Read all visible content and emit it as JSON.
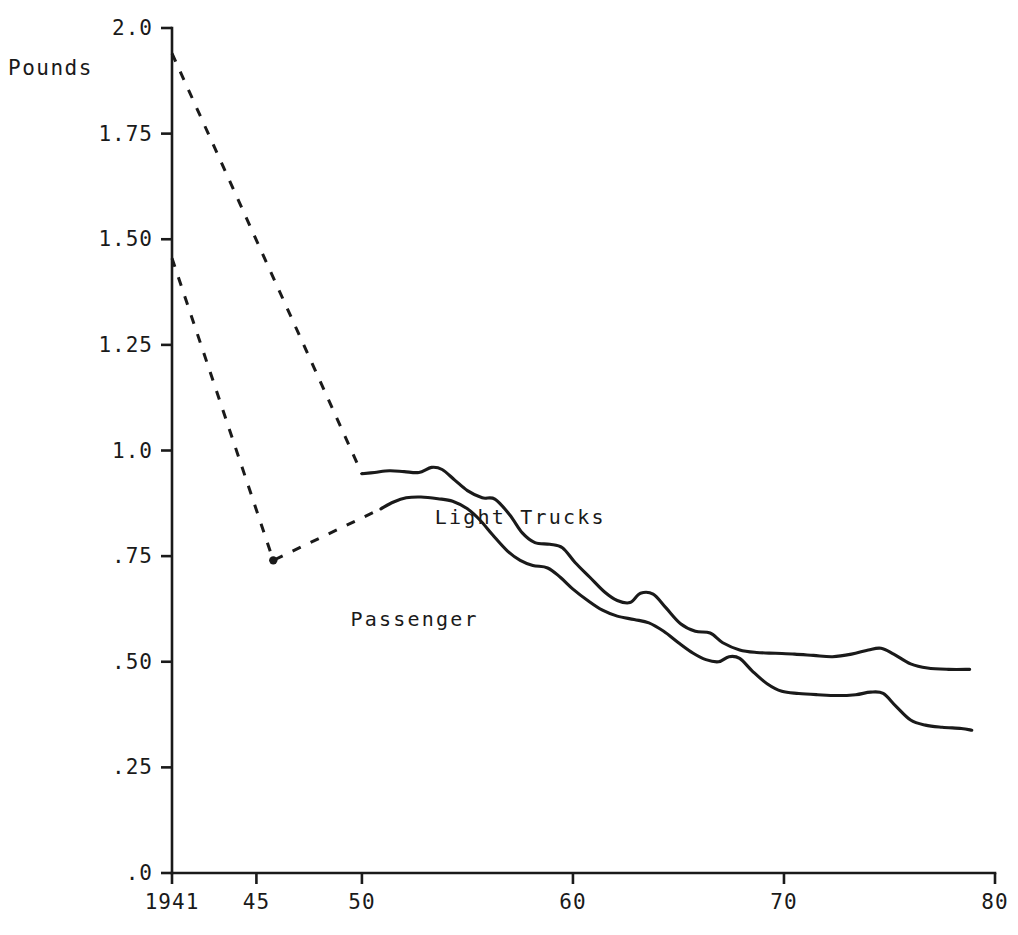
{
  "chart_data": {
    "type": "line",
    "title": "",
    "xlabel": "",
    "ylabel": "Pounds",
    "xlim": [
      1941,
      1980
    ],
    "ylim": [
      0.0,
      2.0
    ],
    "grid": false,
    "legend_position": "inline-annotations",
    "x_tick_labels": [
      "1941",
      "45",
      "50",
      "60",
      "70",
      "80"
    ],
    "x_tick_values": [
      1941,
      1945,
      1950,
      1960,
      1970,
      1980
    ],
    "y_tick_labels": [
      "2.0",
      "1.75",
      "1.50",
      "1.25",
      "1.0",
      ".75",
      ".50",
      ".25",
      ".0"
    ],
    "y_tick_values": [
      2.0,
      1.75,
      1.5,
      1.25,
      1.0,
      0.75,
      0.5,
      0.25,
      0.0
    ],
    "annotations": [
      {
        "text": "Light Trucks",
        "x": 1957.5,
        "y": 0.825
      },
      {
        "text": "Passenger",
        "x": 1952.5,
        "y": 0.585
      }
    ],
    "series": [
      {
        "name": "Light Trucks",
        "style_solid_from": 1950,
        "dashed_points": [
          {
            "x": 1941.0,
            "y": 1.94
          },
          {
            "x": 1950.0,
            "y": 0.945
          }
        ],
        "points": [
          {
            "x": 1950.0,
            "y": 0.945
          },
          {
            "x": 1950.6,
            "y": 0.948
          },
          {
            "x": 1951.3,
            "y": 0.952
          },
          {
            "x": 1952.0,
            "y": 0.95
          },
          {
            "x": 1952.7,
            "y": 0.948
          },
          {
            "x": 1953.3,
            "y": 0.96
          },
          {
            "x": 1953.8,
            "y": 0.955
          },
          {
            "x": 1954.4,
            "y": 0.93
          },
          {
            "x": 1955.0,
            "y": 0.905
          },
          {
            "x": 1955.7,
            "y": 0.888
          },
          {
            "x": 1956.3,
            "y": 0.885
          },
          {
            "x": 1957.0,
            "y": 0.848
          },
          {
            "x": 1957.6,
            "y": 0.805
          },
          {
            "x": 1958.2,
            "y": 0.782
          },
          {
            "x": 1958.9,
            "y": 0.778
          },
          {
            "x": 1959.5,
            "y": 0.77
          },
          {
            "x": 1960.1,
            "y": 0.735
          },
          {
            "x": 1960.8,
            "y": 0.7
          },
          {
            "x": 1961.5,
            "y": 0.665
          },
          {
            "x": 1962.1,
            "y": 0.645
          },
          {
            "x": 1962.7,
            "y": 0.64
          },
          {
            "x": 1963.2,
            "y": 0.662
          },
          {
            "x": 1963.8,
            "y": 0.66
          },
          {
            "x": 1964.4,
            "y": 0.628
          },
          {
            "x": 1965.1,
            "y": 0.59
          },
          {
            "x": 1965.8,
            "y": 0.572
          },
          {
            "x": 1966.5,
            "y": 0.568
          },
          {
            "x": 1967.1,
            "y": 0.545
          },
          {
            "x": 1967.9,
            "y": 0.528
          },
          {
            "x": 1968.7,
            "y": 0.522
          },
          {
            "x": 1969.6,
            "y": 0.52
          },
          {
            "x": 1970.5,
            "y": 0.518
          },
          {
            "x": 1971.4,
            "y": 0.515
          },
          {
            "x": 1972.3,
            "y": 0.512
          },
          {
            "x": 1973.2,
            "y": 0.518
          },
          {
            "x": 1974.0,
            "y": 0.528
          },
          {
            "x": 1974.6,
            "y": 0.532
          },
          {
            "x": 1975.2,
            "y": 0.518
          },
          {
            "x": 1976.0,
            "y": 0.495
          },
          {
            "x": 1976.8,
            "y": 0.485
          },
          {
            "x": 1977.8,
            "y": 0.482
          },
          {
            "x": 1978.8,
            "y": 0.482
          }
        ]
      },
      {
        "name": "Passenger",
        "style_solid_from": 1951,
        "dashed_points": [
          {
            "x": 1941.0,
            "y": 1.455
          },
          {
            "x": 1945.8,
            "y": 0.74
          },
          {
            "x": 1950.9,
            "y": 0.862
          }
        ],
        "points": [
          {
            "x": 1950.9,
            "y": 0.862
          },
          {
            "x": 1951.5,
            "y": 0.878
          },
          {
            "x": 1952.1,
            "y": 0.888
          },
          {
            "x": 1952.8,
            "y": 0.89
          },
          {
            "x": 1953.6,
            "y": 0.886
          },
          {
            "x": 1954.3,
            "y": 0.88
          },
          {
            "x": 1955.0,
            "y": 0.862
          },
          {
            "x": 1955.6,
            "y": 0.835
          },
          {
            "x": 1956.2,
            "y": 0.8
          },
          {
            "x": 1956.9,
            "y": 0.762
          },
          {
            "x": 1957.5,
            "y": 0.74
          },
          {
            "x": 1958.1,
            "y": 0.728
          },
          {
            "x": 1958.8,
            "y": 0.722
          },
          {
            "x": 1959.4,
            "y": 0.7
          },
          {
            "x": 1960.0,
            "y": 0.672
          },
          {
            "x": 1960.7,
            "y": 0.645
          },
          {
            "x": 1961.4,
            "y": 0.622
          },
          {
            "x": 1962.1,
            "y": 0.608
          },
          {
            "x": 1962.9,
            "y": 0.6
          },
          {
            "x": 1963.6,
            "y": 0.592
          },
          {
            "x": 1964.3,
            "y": 0.572
          },
          {
            "x": 1965.0,
            "y": 0.545
          },
          {
            "x": 1965.7,
            "y": 0.52
          },
          {
            "x": 1966.3,
            "y": 0.505
          },
          {
            "x": 1966.9,
            "y": 0.5
          },
          {
            "x": 1967.4,
            "y": 0.512
          },
          {
            "x": 1967.9,
            "y": 0.508
          },
          {
            "x": 1968.5,
            "y": 0.478
          },
          {
            "x": 1969.2,
            "y": 0.448
          },
          {
            "x": 1969.9,
            "y": 0.43
          },
          {
            "x": 1970.7,
            "y": 0.425
          },
          {
            "x": 1971.6,
            "y": 0.422
          },
          {
            "x": 1972.5,
            "y": 0.42
          },
          {
            "x": 1973.4,
            "y": 0.422
          },
          {
            "x": 1974.1,
            "y": 0.428
          },
          {
            "x": 1974.7,
            "y": 0.425
          },
          {
            "x": 1975.3,
            "y": 0.395
          },
          {
            "x": 1976.0,
            "y": 0.362
          },
          {
            "x": 1976.7,
            "y": 0.35
          },
          {
            "x": 1977.5,
            "y": 0.345
          },
          {
            "x": 1978.4,
            "y": 0.342
          },
          {
            "x": 1978.9,
            "y": 0.338
          }
        ]
      }
    ]
  }
}
